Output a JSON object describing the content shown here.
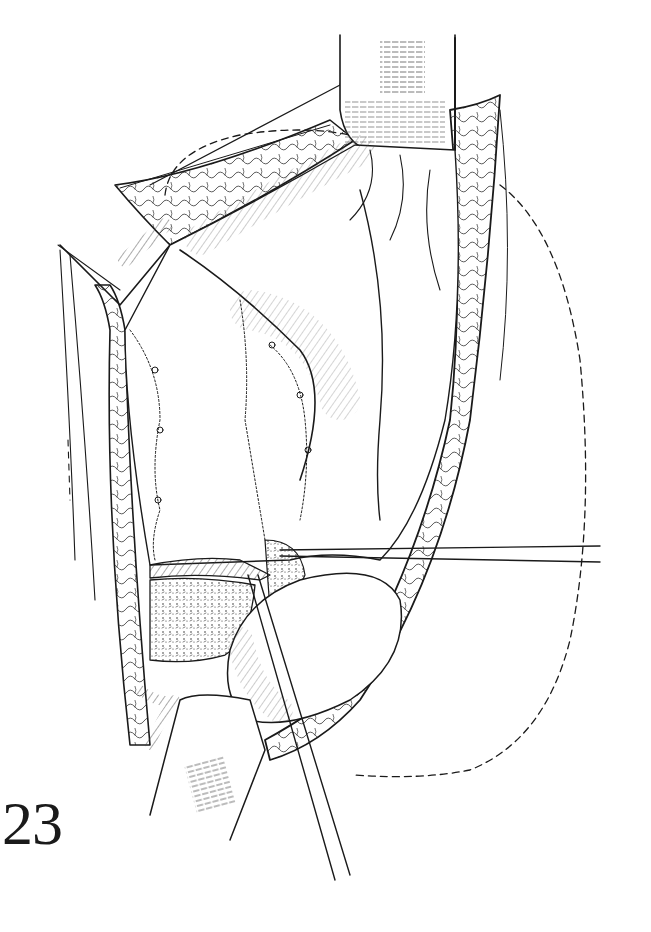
{
  "figure": {
    "number": "23",
    "style": "black-and-white surgical line illustration",
    "ink_color": "#1a1a1a",
    "background_color": "#ffffff"
  },
  "illustration": {
    "elements": [
      {
        "name": "upper-retractor",
        "description": "retractor blade at top center"
      },
      {
        "name": "lower-retractor",
        "description": "retractor blade at bottom left"
      },
      {
        "name": "left-wound-edge",
        "description": "left incision edge with subcutaneous fat pattern"
      },
      {
        "name": "right-wound-edge",
        "description": "right incision edge with subcutaneous fat pattern"
      },
      {
        "name": "sutured-organ",
        "description": "organ surface with interrupted suture lines"
      },
      {
        "name": "horizontal-needle",
        "description": "long straight needle/instrument extending to the right"
      },
      {
        "name": "oblique-needle",
        "description": "long straight needle/instrument extending downward"
      },
      {
        "name": "dashed-outline",
        "description": "dashed contour indicating underlying organ outline"
      }
    ]
  }
}
